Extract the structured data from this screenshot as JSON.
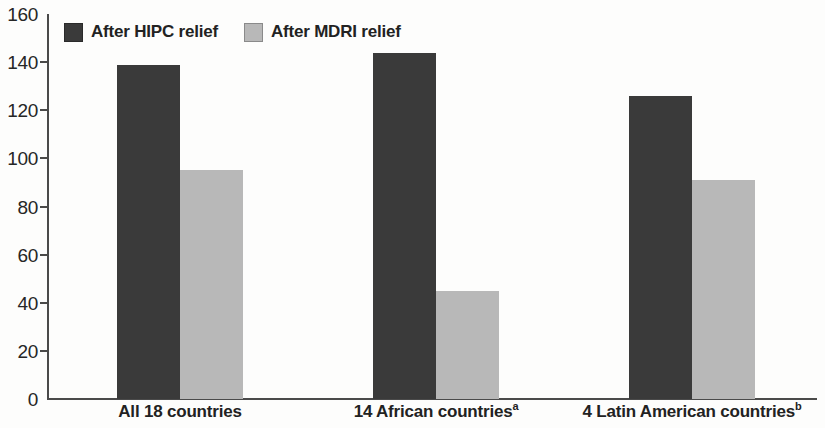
{
  "chart_data": {
    "type": "bar",
    "title": "",
    "subtitle": "",
    "xlabel": "",
    "ylabel": "",
    "ylim": [
      0,
      160
    ],
    "ytick_step": 20,
    "ytick_labels": [
      "0",
      "20",
      "40",
      "60",
      "80",
      "100",
      "120",
      "140",
      "160"
    ],
    "grid": false,
    "legend_position": "top-left-inside",
    "categories": [
      "All 18 countries",
      "14 African countries",
      "4 Latin American countries"
    ],
    "category_footnote_marks": [
      "",
      "a",
      "b"
    ],
    "series": [
      {
        "name": "After HIPC relief",
        "color": "#3a3a3a",
        "values": [
          139,
          144,
          126
        ]
      },
      {
        "name": "After MDRI relief",
        "color": "#b8b8b8",
        "values": [
          95,
          45,
          91
        ]
      }
    ]
  },
  "axis": {
    "line_color": "#4a4a4a"
  },
  "background": {
    "color": "#fdfdfc"
  }
}
